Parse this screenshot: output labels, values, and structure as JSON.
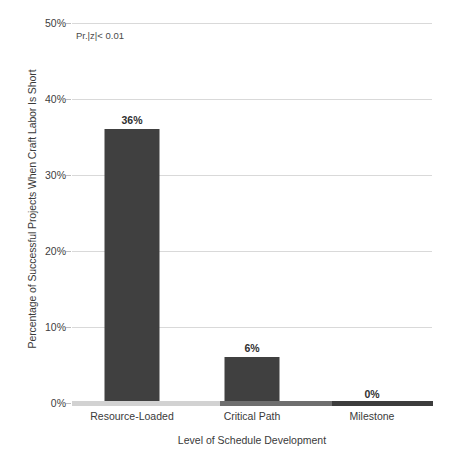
{
  "chart_data": {
    "type": "bar",
    "title": "",
    "subtitle": "",
    "categories": [
      "Resource-Loaded",
      "Critical Path",
      "Milestone"
    ],
    "values": [
      36,
      6,
      0
    ],
    "value_labels": [
      "36%",
      "6%",
      "0%"
    ],
    "xlabel": "Level of Schedule Development",
    "ylabel": "Percentage of Successful Projects When Craft Labor Is Short",
    "ylim": [
      0,
      50
    ],
    "ytick_values": [
      0,
      10,
      20,
      30,
      40,
      50
    ],
    "ytick_labels": [
      "0%",
      "10%",
      "20%",
      "30%",
      "40%",
      "50%"
    ],
    "grid": true,
    "legend": "none",
    "annotations": [
      {
        "text": "Pr.|z|< 0.01",
        "position": "top-left-inside-plot"
      }
    ],
    "colors": {
      "bar": "#404040",
      "gridline": "#d9d9d9",
      "text": "#404040",
      "axis": "#7f7f7f",
      "background": "#ffffff"
    }
  }
}
